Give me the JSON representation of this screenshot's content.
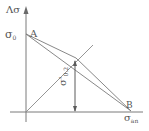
{
  "diagram": {
    "type": "limit-stress-diagram",
    "axes": {
      "y_label_prefix": "Λ",
      "y_label_symbol": "σ",
      "x_label_symbol": "σ",
      "x_label_sub": "an"
    },
    "labels": {
      "sigma0_symbol": "σ",
      "sigma0_sub": "0",
      "point_a": "A",
      "point_b": "B",
      "vertical_symbol": "σ'",
      "vertical_sub": "0.2"
    },
    "colors": {
      "line": "#7a7a7a",
      "text": "#555555",
      "background": "#ffffff"
    }
  }
}
